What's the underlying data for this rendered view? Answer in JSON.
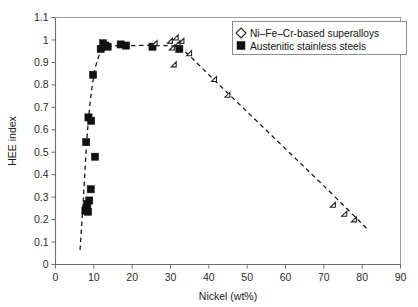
{
  "chart_data": {
    "type": "scatter",
    "title": "",
    "xlabel": "Nickel (wt%)",
    "ylabel": "HEE index",
    "xlim": [
      0,
      90
    ],
    "ylim": [
      0,
      1.1
    ],
    "xticks": [
      0,
      10,
      20,
      30,
      40,
      50,
      60,
      70,
      80,
      90
    ],
    "xtick_labels": [
      "0",
      "10",
      "20",
      "30",
      "40",
      "50",
      "60",
      "70",
      "80",
      "90"
    ],
    "yticks": [
      0,
      0.1,
      0.2,
      0.3,
      0.4,
      0.5,
      0.6,
      0.7,
      0.8,
      0.9,
      1.0,
      1.1
    ],
    "ytick_labels": [
      "0",
      "0.1",
      "0.2",
      "0.3",
      "0.4",
      "0.5",
      "0.6",
      "0.7",
      "0.8",
      "0.9",
      "1",
      "1.1"
    ],
    "grid": false,
    "legend_position": "top-right",
    "series": [
      {
        "name": "Ni–Fe–Cr-based superalloys",
        "marker": "open-diamond",
        "color": "#ffffff",
        "edge_color": "#222222",
        "points": [
          [
            26.5,
            0.975
          ],
          [
            30.5,
            0.985
          ],
          [
            31.0,
            0.955
          ],
          [
            32.0,
            1.0
          ],
          [
            32.5,
            0.975
          ],
          [
            33.5,
            0.985
          ],
          [
            31.5,
            0.88
          ],
          [
            35.5,
            0.93
          ],
          [
            42.0,
            0.815
          ],
          [
            45.5,
            0.745
          ],
          [
            73.0,
            0.255
          ],
          [
            76.0,
            0.215
          ],
          [
            78.5,
            0.19
          ]
        ]
      },
      {
        "name": "Austenitic stainless steels",
        "marker": "filled-square",
        "color": "#111111",
        "edge_color": "#111111",
        "points": [
          [
            7.8,
            0.24
          ],
          [
            8.1,
            0.255
          ],
          [
            8.3,
            0.27
          ],
          [
            8.5,
            0.235
          ],
          [
            8.8,
            0.285
          ],
          [
            9.2,
            0.335
          ],
          [
            10.3,
            0.48
          ],
          [
            8.0,
            0.545
          ],
          [
            9.3,
            0.64
          ],
          [
            8.6,
            0.655
          ],
          [
            9.8,
            0.845
          ],
          [
            11.8,
            0.96
          ],
          [
            12.4,
            0.985
          ],
          [
            13.0,
            0.975
          ],
          [
            13.6,
            0.97
          ],
          [
            17.0,
            0.98
          ],
          [
            18.4,
            0.975
          ],
          [
            25.3,
            0.97
          ],
          [
            32.3,
            0.96
          ]
        ]
      }
    ],
    "trend_curve": {
      "style": "dashed",
      "color": "#111111",
      "points": [
        [
          6.4,
          0.065
        ],
        [
          7.3,
          0.3
        ],
        [
          8.2,
          0.56
        ],
        [
          9.3,
          0.76
        ],
        [
          10.6,
          0.89
        ],
        [
          12.2,
          0.955
        ],
        [
          14.5,
          0.972
        ],
        [
          20.0,
          0.975
        ],
        [
          27.0,
          0.975
        ],
        [
          31.5,
          0.97
        ],
        [
          34.0,
          0.945
        ],
        [
          40.0,
          0.845
        ],
        [
          50.0,
          0.68
        ],
        [
          60.0,
          0.515
        ],
        [
          70.0,
          0.35
        ],
        [
          81.5,
          0.155
        ]
      ]
    }
  },
  "legend": {
    "items": [
      {
        "label": "Ni–Fe–Cr-based superalloys",
        "marker": "open-diamond"
      },
      {
        "label": "Austenitic stainless steels",
        "marker": "filled-square"
      }
    ]
  }
}
